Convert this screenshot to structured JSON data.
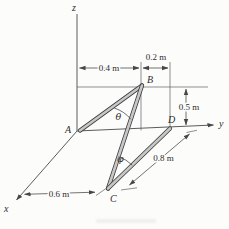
{
  "figure": {
    "axis_labels": {
      "x": "x",
      "y": "y",
      "z": "z"
    },
    "point_labels": {
      "A": "A",
      "B": "B",
      "C": "C",
      "D": "D"
    },
    "angle_labels": {
      "theta": "θ",
      "phi": "φ"
    },
    "dims": {
      "d04": "0.4 m",
      "d02": "0.2 m",
      "d05": "0.5 m",
      "d08": "0.8 m",
      "d06": "0.6 m"
    }
  },
  "colors": {
    "line": "#4a4a4a",
    "rod_edge": "#3d3d3d",
    "rod_fill": "#c7c7c7",
    "text": "#2e2e2e",
    "background": "#fcfcfb"
  }
}
